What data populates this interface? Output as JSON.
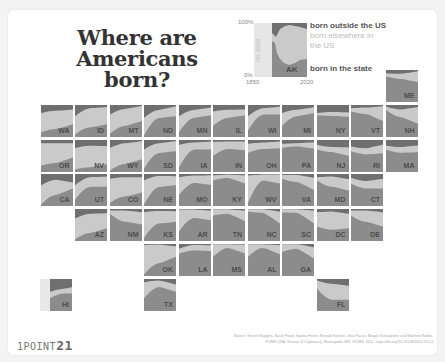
{
  "title": "Where are Americans born?",
  "logo": {
    "prefix": "1POINT",
    "suffix": "21"
  },
  "source_line1": "Source: Steven Ruggles, Sarah Flood, Sophia Foster, Ronald Goeken, Jose Pacas, Megan Schouweiler and Matthew Sobek.",
  "source_line2": "IPUMS USA: Version 11.0 [dataset]. Minneapolis, MN: IPUMS, 2021. https://doi.org/10.18128/D010.V11.0",
  "colors": {
    "outside_us": "#6f6f6f",
    "elsewhere_us": "#cacaca",
    "in_state": "#8c8c8c",
    "no_data": "#e8e8e8"
  },
  "legend": {
    "y_top": "100%",
    "y_bottom": "0%",
    "x_start": "1850",
    "x_end": "2020",
    "no_data_label": "no data",
    "state": "AK",
    "label_outside": "born outside the US",
    "label_elsewhere": "born elsewhere in the US",
    "label_state": "born in the state"
  },
  "chart_data": {
    "type": "area",
    "title": "Where are Americans born?",
    "xlabel": "Year",
    "ylabel": "Share of residents",
    "x_range": [
      1850,
      2020
    ],
    "ylim": [
      0,
      100
    ],
    "series_names": [
      "born in the state",
      "born elsewhere in the US",
      "born outside the US"
    ],
    "note": "Small-multiple stacked area charts (tile-grid map). Values per state: [in_state% at 1850, mid, 2020] and [outside% at 1850, mid, 2020], estimated visually.",
    "states": [
      {
        "abbr": "ME",
        "col": 11,
        "row": 0,
        "in_state": [
          80,
          72,
          62
        ],
        "outside": [
          10,
          12,
          4
        ]
      },
      {
        "abbr": "WA",
        "col": 1,
        "row": 1,
        "in_state": [
          15,
          25,
          40
        ],
        "outside": [
          25,
          18,
          14
        ]
      },
      {
        "abbr": "ID",
        "col": 2,
        "row": 1,
        "in_state": [
          8,
          30,
          40
        ],
        "outside": [
          35,
          10,
          6
        ]
      },
      {
        "abbr": "MT",
        "col": 3,
        "row": 1,
        "in_state": [
          10,
          35,
          50
        ],
        "outside": [
          30,
          12,
          3
        ]
      },
      {
        "abbr": "ND",
        "col": 4,
        "row": 1,
        "in_state": [
          5,
          60,
          65
        ],
        "outside": [
          40,
          15,
          4
        ]
      },
      {
        "abbr": "MN",
        "col": 5,
        "row": 1,
        "in_state": [
          15,
          60,
          68
        ],
        "outside": [
          35,
          15,
          8
        ]
      },
      {
        "abbr": "IL",
        "col": 6,
        "row": 1,
        "in_state": [
          35,
          60,
          68
        ],
        "outside": [
          20,
          15,
          14
        ]
      },
      {
        "abbr": "WI",
        "col": 7,
        "row": 1,
        "in_state": [
          20,
          70,
          70
        ],
        "outside": [
          35,
          10,
          5
        ]
      },
      {
        "abbr": "MI",
        "col": 8,
        "row": 1,
        "in_state": [
          35,
          65,
          75
        ],
        "outside": [
          25,
          15,
          7
        ]
      },
      {
        "abbr": "NY",
        "col": 9,
        "row": 1,
        "in_state": [
          68,
          66,
          63
        ],
        "outside": [
          25,
          22,
          23
        ]
      },
      {
        "abbr": "VT",
        "col": 10,
        "row": 1,
        "in_state": [
          80,
          72,
          50
        ],
        "outside": [
          10,
          8,
          4
        ]
      },
      {
        "abbr": "NH",
        "col": 11,
        "row": 1,
        "in_state": [
          85,
          62,
          42
        ],
        "outside": [
          5,
          14,
          6
        ]
      },
      {
        "abbr": "OR",
        "col": 1,
        "row": 2,
        "in_state": [
          20,
          28,
          45
        ],
        "outside": [
          10,
          10,
          10
        ]
      },
      {
        "abbr": "NV",
        "col": 2,
        "row": 2,
        "in_state": [
          8,
          15,
          25
        ],
        "outside": [
          25,
          18,
          19
        ]
      },
      {
        "abbr": "WY",
        "col": 3,
        "row": 2,
        "in_state": [
          5,
          25,
          40
        ],
        "outside": [
          25,
          10,
          4
        ]
      },
      {
        "abbr": "SD",
        "col": 4,
        "row": 2,
        "in_state": [
          10,
          60,
          65
        ],
        "outside": [
          30,
          10,
          3
        ]
      },
      {
        "abbr": "IA",
        "col": 5,
        "row": 2,
        "in_state": [
          15,
          70,
          70
        ],
        "outside": [
          15,
          8,
          5
        ]
      },
      {
        "abbr": "IN",
        "col": 6,
        "row": 2,
        "in_state": [
          50,
          72,
          68
        ],
        "outside": [
          6,
          5,
          5
        ]
      },
      {
        "abbr": "OH",
        "col": 7,
        "row": 2,
        "in_state": [
          60,
          72,
          74
        ],
        "outside": [
          12,
          8,
          5
        ]
      },
      {
        "abbr": "PA",
        "col": 8,
        "row": 2,
        "in_state": [
          75,
          80,
          73
        ],
        "outside": [
          12,
          10,
          7
        ]
      },
      {
        "abbr": "NJ",
        "col": 9,
        "row": 2,
        "in_state": [
          70,
          62,
          50
        ],
        "outside": [
          15,
          22,
          23
        ]
      },
      {
        "abbr": "RI",
        "col": 10,
        "row": 2,
        "in_state": [
          65,
          55,
          58
        ],
        "outside": [
          20,
          26,
          14
        ]
      },
      {
        "abbr": "MA",
        "col": 11,
        "row": 2,
        "in_state": [
          70,
          60,
          62
        ],
        "outside": [
          18,
          22,
          17
        ]
      },
      {
        "abbr": "CA",
        "col": 1,
        "row": 3,
        "in_state": [
          5,
          35,
          55
        ],
        "outside": [
          35,
          18,
          27
        ]
      },
      {
        "abbr": "UT",
        "col": 2,
        "row": 3,
        "in_state": [
          20,
          60,
          60
        ],
        "outside": [
          35,
          10,
          8
        ]
      },
      {
        "abbr": "CO",
        "col": 3,
        "row": 3,
        "in_state": [
          10,
          30,
          42
        ],
        "outside": [
          15,
          10,
          10
        ]
      },
      {
        "abbr": "NE",
        "col": 4,
        "row": 3,
        "in_state": [
          5,
          60,
          65
        ],
        "outside": [
          20,
          6,
          7
        ]
      },
      {
        "abbr": "MO",
        "col": 5,
        "row": 3,
        "in_state": [
          35,
          72,
          66
        ],
        "outside": [
          10,
          5,
          4
        ]
      },
      {
        "abbr": "KY",
        "col": 6,
        "row": 3,
        "in_state": [
          80,
          88,
          70
        ],
        "outside": [
          5,
          2,
          4
        ]
      },
      {
        "abbr": "WV",
        "col": 7,
        "row": 3,
        "in_state": [
          10,
          80,
          70
        ],
        "outside": [
          5,
          2,
          1
        ]
      },
      {
        "abbr": "VA",
        "col": 8,
        "row": 3,
        "in_state": [
          85,
          75,
          50
        ],
        "outside": [
          3,
          3,
          12
        ]
      },
      {
        "abbr": "MD",
        "col": 9,
        "row": 3,
        "in_state": [
          80,
          60,
          48
        ],
        "outside": [
          10,
          8,
          16
        ]
      },
      {
        "abbr": "CT",
        "col": 10,
        "row": 3,
        "in_state": [
          70,
          55,
          55
        ],
        "outside": [
          12,
          22,
          15
        ]
      },
      {
        "abbr": "AZ",
        "col": 2,
        "row": 4,
        "in_state": [
          5,
          25,
          40
        ],
        "outside": [
          30,
          15,
          13
        ]
      },
      {
        "abbr": "NM",
        "col": 3,
        "row": 4,
        "in_state": [
          85,
          60,
          52
        ],
        "outside": [
          5,
          5,
          10
        ]
      },
      {
        "abbr": "KS",
        "col": 4,
        "row": 4,
        "in_state": [
          10,
          55,
          60
        ],
        "outside": [
          10,
          6,
          7
        ]
      },
      {
        "abbr": "AR",
        "col": 5,
        "row": 4,
        "in_state": [
          30,
          72,
          65
        ],
        "outside": [
          2,
          2,
          5
        ]
      },
      {
        "abbr": "TN",
        "col": 6,
        "row": 4,
        "in_state": [
          80,
          85,
          62
        ],
        "outside": [
          1,
          1,
          5
        ]
      },
      {
        "abbr": "NC",
        "col": 7,
        "row": 4,
        "in_state": [
          92,
          88,
          55
        ],
        "outside": [
          1,
          1,
          8
        ]
      },
      {
        "abbr": "SC",
        "col": 8,
        "row": 4,
        "in_state": [
          90,
          88,
          55
        ],
        "outside": [
          1,
          1,
          5
        ]
      },
      {
        "abbr": "DC",
        "col": 9,
        "row": 4,
        "in_state": [
          45,
          35,
          40
        ],
        "outside": [
          10,
          8,
          15
        ]
      },
      {
        "abbr": "DE",
        "col": 10,
        "row": 4,
        "in_state": [
          80,
          60,
          45
        ],
        "outside": [
          5,
          5,
          10
        ]
      },
      {
        "abbr": "OK",
        "col": 4,
        "row": 5,
        "in_state": [
          5,
          40,
          60
        ],
        "outside": [
          3,
          2,
          7
        ]
      },
      {
        "abbr": "LA",
        "col": 5,
        "row": 5,
        "in_state": [
          70,
          80,
          78
        ],
        "outside": [
          15,
          3,
          4
        ]
      },
      {
        "abbr": "MS",
        "col": 6,
        "row": 5,
        "in_state": [
          60,
          88,
          70
        ],
        "outside": [
          1,
          1,
          2
        ]
      },
      {
        "abbr": "AL",
        "col": 7,
        "row": 5,
        "in_state": [
          60,
          88,
          68
        ],
        "outside": [
          1,
          1,
          4
        ]
      },
      {
        "abbr": "GA",
        "col": 8,
        "row": 5,
        "in_state": [
          75,
          85,
          55
        ],
        "outside": [
          1,
          1,
          10
        ]
      },
      {
        "abbr": "HI",
        "col": 1,
        "row": 6,
        "in_state": [
          40,
          55,
          55
        ],
        "outside": [
          40,
          30,
          18
        ],
        "partial": true
      },
      {
        "abbr": "TX",
        "col": 4,
        "row": 6,
        "in_state": [
          40,
          75,
          60
        ],
        "outside": [
          10,
          5,
          17
        ]
      },
      {
        "abbr": "FL",
        "col": 9,
        "row": 6,
        "in_state": [
          70,
          35,
          35
        ],
        "outside": [
          5,
          15,
          21
        ]
      }
    ]
  }
}
